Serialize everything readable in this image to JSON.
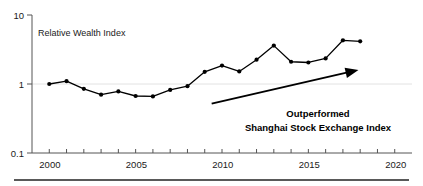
{
  "chart_data": {
    "type": "line",
    "title": "",
    "series_label": "Relative Wealth Index",
    "xlabel": "",
    "ylabel": "",
    "yscale": "log",
    "ylim": [
      0.1,
      10
    ],
    "xlim": [
      1999,
      2021
    ],
    "grid": "horizontal-at-1",
    "legend_position": "none",
    "y_ticks": [
      "10",
      "1",
      "0.1"
    ],
    "y_tick_values": [
      10,
      1,
      0.1
    ],
    "x_ticks": [
      "2000",
      "2005",
      "2010",
      "2015",
      "2020"
    ],
    "x_tick_values": [
      2000,
      2005,
      2010,
      2015,
      2020
    ],
    "x_minor_tick_values": [
      2001,
      2002,
      2003,
      2004,
      2006,
      2007,
      2008,
      2009,
      2011,
      2012,
      2013,
      2014,
      2016,
      2017,
      2018,
      2019
    ],
    "x": [
      2000,
      2001,
      2002,
      2003,
      2004,
      2005,
      2006,
      2007,
      2008,
      2009,
      2010,
      2011,
      2012,
      2013,
      2014,
      2015,
      2016,
      2017,
      2018
    ],
    "values": [
      1.0,
      1.1,
      0.85,
      0.7,
      0.78,
      0.67,
      0.66,
      0.82,
      0.93,
      1.5,
      1.85,
      1.52,
      2.25,
      3.6,
      2.1,
      2.05,
      2.35,
      4.3,
      4.15
    ],
    "annotations": [
      {
        "name": "outperformed-callout",
        "line1": "Outperformed",
        "line2": "Shanghai Stock Exchange Index"
      }
    ],
    "arrow": {
      "name": "upward-trend-arrow",
      "from": [
        2009.4,
        0.52
      ],
      "to": [
        2017.9,
        1.6
      ]
    },
    "colors": {
      "line": "#000000",
      "marker": "#000000",
      "axis": "#555555",
      "grid": "#e2e2e2",
      "text": "#1a1a1a",
      "annotation": "#000000",
      "background": "#ffffff"
    }
  }
}
